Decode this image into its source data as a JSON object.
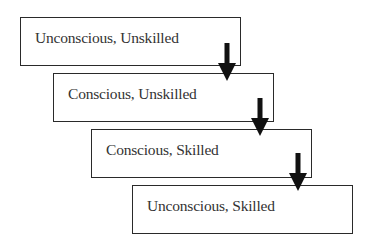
{
  "diagram": {
    "type": "stepped-flow",
    "stages": [
      {
        "label": "Unconscious, Unskilled"
      },
      {
        "label": "Conscious, Unskilled"
      },
      {
        "label": "Conscious, Skilled"
      },
      {
        "label": "Unconscious, Skilled"
      }
    ],
    "colors": {
      "border": "#2a2a2a",
      "arrow": "#111111",
      "text": "#333333",
      "background": "#ffffff"
    }
  }
}
